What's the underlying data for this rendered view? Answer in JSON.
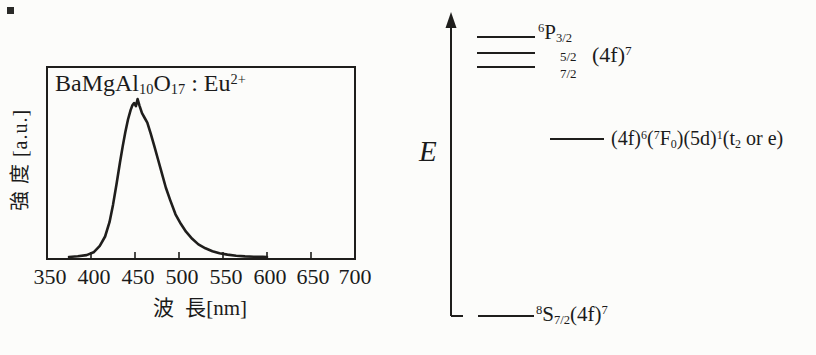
{
  "colors": {
    "ink": "#1f1e1c",
    "paper": "#fcfcfa"
  },
  "figure": {
    "left_panel": {
      "title_parts": [
        {
          "t": "BaMgAl"
        },
        {
          "t": "10",
          "s": "sub"
        },
        {
          "t": "O"
        },
        {
          "t": "17",
          "s": "sub"
        },
        {
          "t": " : Eu"
        },
        {
          "t": "2+",
          "s": "sup"
        }
      ],
      "ylabel": "強 度 [a.u.]",
      "xlabel": "波 長[nm]"
    },
    "right_panel": {
      "axis_label": "E",
      "levels": {
        "p32_parts": [
          {
            "t": "6",
            "s": "sup"
          },
          {
            "t": "P"
          },
          {
            "t": "3/2",
            "s": "sub"
          }
        ],
        "p52": "5/2",
        "p72": "7/2",
        "conf_4f7_parts": [
          {
            "t": "(4f)"
          },
          {
            "t": "7",
            "s": "sup"
          }
        ],
        "excited_parts": [
          {
            "t": "(4f)"
          },
          {
            "t": "6",
            "s": "sup"
          },
          {
            "t": "("
          },
          {
            "t": "7",
            "s": "sup"
          },
          {
            "t": "F"
          },
          {
            "t": "0",
            "s": "sub"
          },
          {
            "t": ")(5d)"
          },
          {
            "t": "1",
            "s": "sup"
          },
          {
            "t": "(t"
          },
          {
            "t": "2",
            "s": "sub"
          },
          {
            "t": " or e)"
          }
        ],
        "ground_parts": [
          {
            "t": "8",
            "s": "sup"
          },
          {
            "t": "S"
          },
          {
            "t": "7/2",
            "s": "sub"
          },
          {
            "t": "(4f)"
          },
          {
            "t": "7",
            "s": "sup"
          }
        ]
      }
    }
  },
  "chart_data": {
    "type": "line",
    "xlabel": "波 長[nm] (wavelength)",
    "ylabel": "強 度 [a.u.] (intensity)",
    "xlim": [
      350,
      700
    ],
    "ylim": [
      0,
      1
    ],
    "grid": false,
    "x_ticks": [
      350,
      400,
      450,
      500,
      550,
      600,
      650,
      700
    ],
    "peak_nm": 453,
    "x": [
      375,
      385,
      395,
      403,
      410,
      416,
      421,
      425,
      429,
      433,
      436,
      439,
      442,
      445,
      447,
      449,
      451,
      453,
      455,
      458,
      461,
      464,
      468,
      472,
      476,
      480,
      485,
      490,
      496,
      502,
      508,
      515,
      522,
      530,
      538,
      546,
      555,
      565,
      575,
      585,
      595,
      600
    ],
    "y": [
      0,
      0.005,
      0.012,
      0.03,
      0.07,
      0.13,
      0.22,
      0.33,
      0.46,
      0.6,
      0.7,
      0.79,
      0.87,
      0.93,
      0.96,
      0.975,
      0.955,
      1.0,
      0.96,
      0.91,
      0.88,
      0.85,
      0.78,
      0.7,
      0.62,
      0.54,
      0.44,
      0.36,
      0.27,
      0.21,
      0.16,
      0.115,
      0.08,
      0.055,
      0.037,
      0.024,
      0.015,
      0.008,
      0.004,
      0.002,
      0.001,
      0
    ]
  }
}
